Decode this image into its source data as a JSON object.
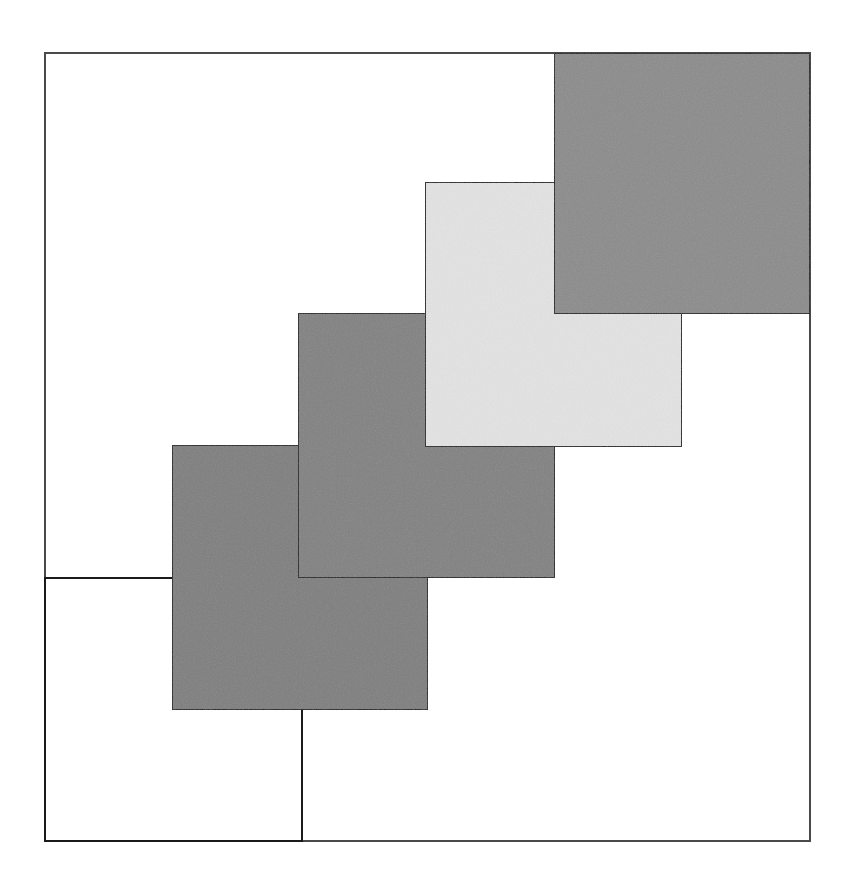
{
  "figure": {
    "canvas_width": 850,
    "canvas_height": 884,
    "background_color": "#ffffff",
    "outline_color": "#1a1a1a",
    "outline_width": 2
  },
  "frame": {
    "name": "outer-frame",
    "x": 45,
    "y": 53,
    "width": 765,
    "height": 788,
    "fill": "none",
    "stroke": "#4a4a4a",
    "stroke_width": 2
  },
  "chart_data": {
    "type": "diagram",
    "shape": "square",
    "count": 5,
    "square_size": 257,
    "step_x": 128,
    "step_y": -133,
    "draw_order": "bottom-left first, top-right last (later squares overlap earlier)",
    "xlabel": "",
    "ylabel": "",
    "squares": [
      {
        "index": 1,
        "label": "square-1",
        "position": "bottom-left",
        "x": 45,
        "y": 578,
        "width": 257,
        "height": 263,
        "fill": "#ffffff",
        "fill_name": "white",
        "stroke": "#1a1a1a",
        "stroke_width": 2
      },
      {
        "index": 2,
        "label": "square-2",
        "position": "lower-middle",
        "x": 172,
        "y": 445,
        "width": 256,
        "height": 265,
        "fill": "#7e7e7e",
        "fill_name": "medium-gray",
        "stroke": "#1a1a1a",
        "stroke_width": 2
      },
      {
        "index": 3,
        "label": "square-3",
        "position": "center",
        "x": 298,
        "y": 313,
        "width": 257,
        "height": 265,
        "fill": "#818181",
        "fill_name": "medium-gray",
        "stroke": "#1a1a1a",
        "stroke_width": 2
      },
      {
        "index": 4,
        "label": "square-4",
        "position": "upper-middle",
        "x": 425,
        "y": 182,
        "width": 257,
        "height": 265,
        "fill": "#e3e3e3",
        "fill_name": "light-gray",
        "stroke": "#1a1a1a",
        "stroke_width": 2
      },
      {
        "index": 5,
        "label": "square-5",
        "position": "top-right",
        "x": 554,
        "y": 53,
        "width": 256,
        "height": 261,
        "fill": "#8b8b8b",
        "fill_name": "dark-gray",
        "stroke": "#1a1a1a",
        "stroke_width": 2
      }
    ]
  }
}
